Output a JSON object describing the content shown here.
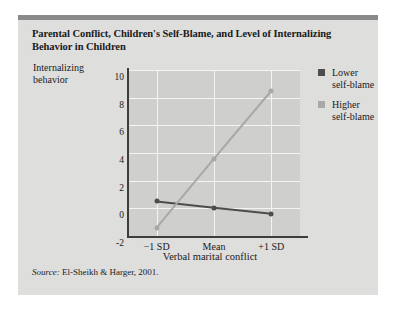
{
  "figure": {
    "title": "Parental Conflict, Children's Self-Blame, and Level of Internalizing Behavior in Children",
    "source_word": "Source:",
    "source_text": " El-Sheikh & Harger, 2001."
  },
  "colors": {
    "card_background": "#dededd",
    "top_bar": "#8a8a8a",
    "plot_background": "#cfcfce",
    "gridline": "#f4f4f3",
    "axis": "#3d3d3d",
    "series_lower": "#4d4d4d",
    "series_higher": "#a8a8a8"
  },
  "chart_data": {
    "type": "line",
    "title": "Parental Conflict, Children's Self-Blame, and Level of Internalizing Behavior in Children",
    "xlabel": "Verbal marital conflict",
    "ylabel": "Internalizing behavior",
    "categories": [
      "−1 SD",
      "Mean",
      "+1 SD"
    ],
    "series": [
      {
        "name": "Lower self-blame",
        "values": [
          0.5,
          0.05,
          -0.4
        ],
        "color": "#4d4d4d"
      },
      {
        "name": "Higher self-blame",
        "values": [
          -1.4,
          3.6,
          8.5
        ],
        "color": "#a8a8a8"
      }
    ],
    "ylim": [
      -2,
      10
    ],
    "yticks": [
      10,
      8,
      6,
      4,
      2,
      0,
      -2
    ],
    "grid": true,
    "legend_position": "right"
  },
  "legend": {
    "items": [
      {
        "label_line1": "Lower",
        "label_line2": "self-blame",
        "color": "#4d4d4d"
      },
      {
        "label_line1": "Higher",
        "label_line2": "self-blame",
        "color": "#a8a8a8"
      }
    ]
  }
}
